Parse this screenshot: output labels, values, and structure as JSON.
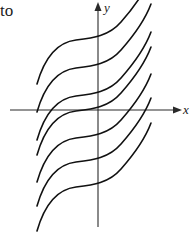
{
  "text_fragment": "to",
  "axes": {
    "x_label": "x",
    "y_label": "y"
  },
  "diagram": {
    "curve_count": 7,
    "y_axis_crossings_px": [
      39,
      67,
      96,
      110,
      138,
      162,
      186
    ],
    "colors": {
      "curves": "#111111",
      "axes": "#2a2a2a",
      "background": "#ffffff"
    }
  }
}
